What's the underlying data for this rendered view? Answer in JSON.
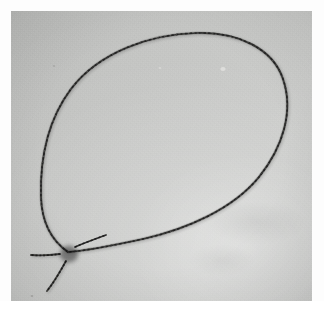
{
  "image": {
    "kind": "photograph",
    "medium": "black-and-white print",
    "subject": "cord loop with sliding bead knot",
    "alt_text": "Black and white photograph of a thin cord formed into a large teardrop-shaped loop, gathered at the bottom left by a dark round bead, with two loose cord tails trailing away",
    "width_px": 324,
    "height_px": 310
  },
  "print": {
    "paper_margin_color": "#fdfdfd",
    "plate_left_px": 11,
    "plate_top_px": 11,
    "plate_width_px": 301,
    "plate_height_px": 290,
    "background_tone": "#c2c3c1",
    "background_tone_light": "#cfd0ce",
    "background_tone_dark": "#b6b7b5"
  },
  "objects": {
    "cord": {
      "label": "cord",
      "color": "#3a3a3a",
      "color_light": "#6a6a68",
      "stroke_width_px": 1.7,
      "description": "thin braided cord forming a closed teardrop loop"
    },
    "bead": {
      "label": "bead",
      "center_x": 57,
      "center_y": 241,
      "radius_px": 8.5,
      "color": "#1d1d1d",
      "color_rim": "#4a4a48",
      "highlight_color": "#a8a8a4",
      "description": "dark cylindrical bead or sliding knot where the cord ends meet"
    },
    "tails": [
      {
        "label": "left-tail",
        "description": "short cord tail running horizontally to the left of the bead"
      },
      {
        "label": "lower-tail",
        "description": "cord tail angling down and to the left below the bead"
      }
    ]
  },
  "geometry": {
    "loop_path": "M 57 241 C 44 232, 31 216, 30 186 C 29 150, 36 110, 60 78 C 88 41, 140 23, 186 22 C 228 21, 262 38, 272 68 C 283 100, 272 136, 248 166 C 222 198, 176 218, 132 228 C 104 234, 74 240, 57 241 Z",
    "loop_left_arc": "M 57 241 C 44 232, 31 216, 30 186 C 29 150, 36 110, 60 78 C 88 41, 140 23, 186 22",
    "loop_right_arc": "M 186 22 C 228 21, 262 38, 272 68 C 283 100, 272 136, 248 166 C 222 198, 176 218, 132 228 C 104 234, 74 240, 57 241",
    "left_tail_path": "M 49 243 C 41 244, 31 245, 20 244",
    "lower_tail_path": "M 55 250 C 50 259, 44 270, 36 280",
    "upper_right_stub_path": "M 64 236 C 73 232, 84 228, 95 224"
  },
  "blemishes": [
    {
      "label": "light-speck-upper-right",
      "x": 212,
      "y": 58,
      "r": 2.4,
      "tone": "#e4e4e2"
    },
    {
      "label": "light-speck-mid",
      "x": 149,
      "y": 57,
      "r": 1.3,
      "tone": "#dddddb"
    },
    {
      "label": "dark-fleck-upper-left",
      "x": 43,
      "y": 55,
      "r": 1.1,
      "tone": "#9b9b99"
    },
    {
      "label": "dark-fleck-lower-left",
      "x": 21,
      "y": 285,
      "r": 1.2,
      "tone": "#8d8d8b"
    }
  ]
}
